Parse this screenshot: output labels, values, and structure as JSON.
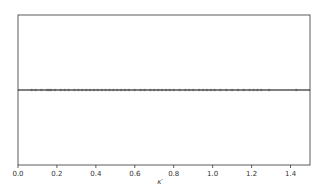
{
  "chart_data": {
    "type": "scatter",
    "title": "",
    "xlabel": "κ′",
    "ylabel": "",
    "xlim": [
      0.0,
      1.5
    ],
    "ylim": [
      -1,
      1
    ],
    "grid": false,
    "legend": null,
    "xticks": [
      "0.0",
      "0.2",
      "0.4",
      "0.6",
      "0.8",
      "1.0",
      "1.2",
      "1.4"
    ],
    "yticks": [],
    "hline": {
      "y": 0,
      "color": "#000000"
    },
    "series": [
      {
        "name": "points",
        "marker": "o",
        "color": "#555555",
        "y_constant": 0,
        "x": [
          0.07,
          0.09,
          0.12,
          0.15,
          0.16,
          0.17,
          0.19,
          0.22,
          0.24,
          0.26,
          0.29,
          0.31,
          0.33,
          0.35,
          0.37,
          0.39,
          0.41,
          0.43,
          0.45,
          0.47,
          0.49,
          0.51,
          0.53,
          0.55,
          0.57,
          0.6,
          0.63,
          0.65,
          0.68,
          0.7,
          0.72,
          0.74,
          0.76,
          0.78,
          0.8,
          0.83,
          0.86,
          0.88,
          0.9,
          0.93,
          0.95,
          0.97,
          0.99,
          1.01,
          1.04,
          1.07,
          1.1,
          1.13,
          1.16,
          1.19,
          1.21,
          1.23,
          1.25,
          1.29,
          1.43
        ]
      }
    ]
  }
}
